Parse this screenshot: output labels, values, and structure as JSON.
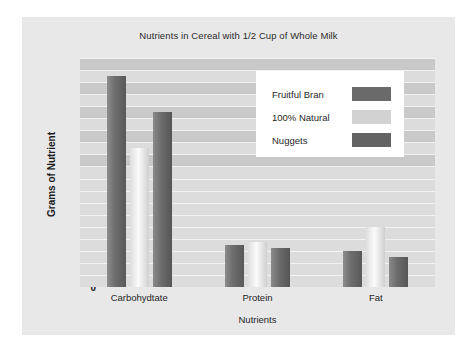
{
  "chart_data": {
    "type": "bar",
    "title": "Nutrients in Cereal with 1/2 Cup of Whole Milk",
    "xlabel": "Nutrients",
    "ylabel": "Grams of Nutrient",
    "categories": [
      "Carbohydtate",
      "Protein",
      "Fat"
    ],
    "series": [
      {
        "name": "Fruitful Bran",
        "color": "#6a6a6a",
        "values": [
          35,
          7,
          6
        ]
      },
      {
        "name": "100% Natural",
        "color": "#d2d2d2",
        "values": [
          23,
          7.5,
          10
        ]
      },
      {
        "name": "Nuggets",
        "color": "#636363",
        "values": [
          29,
          6.5,
          5
        ]
      }
    ],
    "ylim": [
      0,
      38
    ],
    "ytick_labels": [
      "36",
      "32",
      "28",
      "24",
      "20",
      "16",
      "12",
      "8",
      "4",
      "0"
    ],
    "ytick_values": [
      36,
      32,
      28,
      24,
      20,
      16,
      12,
      8,
      4,
      0
    ],
    "gridline_step": 2,
    "grid": true,
    "legend_position": "upper-right",
    "plot_background": "#dcdcdc",
    "canvas_background": "#e8e8e8"
  }
}
